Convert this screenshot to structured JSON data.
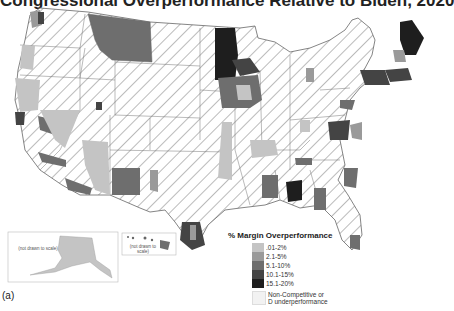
{
  "title": "Congressional Overperformance Relative to Biden, 2020",
  "legend": {
    "title": "% Margin Overperformance",
    "items": [
      {
        "label": ".01-2%",
        "color": "#c4c4c4"
      },
      {
        "label": "2.1-5%",
        "color": "#9a9a9a"
      },
      {
        "label": "5.1-10%",
        "color": "#6e6e6e"
      },
      {
        "label": "10.1-15%",
        "color": "#444444"
      },
      {
        "label": "15.1-20%",
        "color": "#1e1e1e"
      }
    ],
    "non_competitive": "Non-Competitive or D underperformance"
  },
  "insets": {
    "alaska_note": "(not drawn to scale)",
    "hawaii_note": "(not drawn to scale)"
  },
  "caption": "(a)",
  "colors": {
    "hatch": "#555555",
    "border": "#666666",
    "background": "#ffffff"
  }
}
